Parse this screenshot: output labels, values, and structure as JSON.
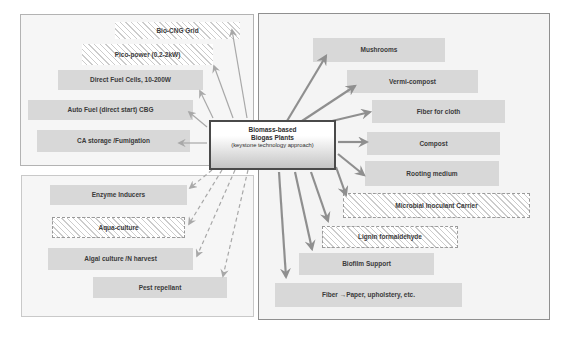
{
  "center_node": {
    "line1": "Biomass-based",
    "line2": "Biogas Plants",
    "line3": "(keystone technology approach)"
  },
  "panels": {
    "energy": {
      "items": [
        {
          "label": "Bio-CNG Grid",
          "pattern": "hatched"
        },
        {
          "label": "Pico-power (0.2-2kW)",
          "pattern": "hatched"
        },
        {
          "label": "Direct Fuel Cells, 10-200W",
          "pattern": "solid"
        },
        {
          "label": "Auto Fuel (direct start) CBG",
          "pattern": "solid"
        },
        {
          "label": "CA storage /Fumigation",
          "pattern": "solid"
        }
      ]
    },
    "bio": {
      "items": [
        {
          "label": "Enzyme Inducers",
          "pattern": "solid"
        },
        {
          "label": "Aqua-culture",
          "pattern": "hatched-dashed"
        },
        {
          "label": "Algal culture /N harvest",
          "pattern": "solid"
        },
        {
          "label": "Pest repellant",
          "pattern": "solid"
        }
      ]
    },
    "agri": {
      "items": [
        {
          "label": "Mushrooms",
          "pattern": "solid"
        },
        {
          "label": "Vermi-compost",
          "pattern": "solid"
        },
        {
          "label": "Fiber for cloth",
          "pattern": "solid"
        },
        {
          "label": "Compost",
          "pattern": "solid"
        },
        {
          "label": "Rooting medium",
          "pattern": "solid"
        },
        {
          "label": "Microbial Inoculant Carrier",
          "pattern": "hatched-dashed"
        },
        {
          "label": "Lignin formaldehyde",
          "pattern": "hatched-dashed"
        },
        {
          "label": "Biofilm Support",
          "pattern": "solid"
        },
        {
          "label": "Fiber →Paper, upholstery, etc.",
          "pattern": "solid"
        }
      ]
    }
  },
  "connections": {
    "from": "Biomass-based Biogas Plants",
    "groups": [
      {
        "targets": [
          "Bio-CNG Grid",
          "Pico-power (0.2-2kW)",
          "Direct Fuel Cells, 10-200W",
          "Auto Fuel (direct start) CBG",
          "CA storage /Fumigation"
        ],
        "line_style": "solid-thin"
      },
      {
        "targets": [
          "Enzyme Inducers",
          "Aqua-culture",
          "Algal culture /N harvest",
          "Pest repellant"
        ],
        "line_style": "dashed"
      },
      {
        "targets": [
          "Mushrooms",
          "Vermi-compost",
          "Fiber for cloth",
          "Compost",
          "Rooting medium",
          "Microbial Inoculant Carrier",
          "Lignin formaldehyde",
          "Biofilm Support",
          "Fiber →Paper, upholstery, etc."
        ],
        "line_style": "solid-thick"
      }
    ]
  },
  "colors": {
    "item_fill": "#d8d8d8",
    "hatch_line": "#cccccc",
    "panel_fill": "#f6f6f6",
    "arrow_thin": "#a8a8a8",
    "arrow_thick": "#8f8f8f",
    "center_border": "#4a4a4a"
  }
}
